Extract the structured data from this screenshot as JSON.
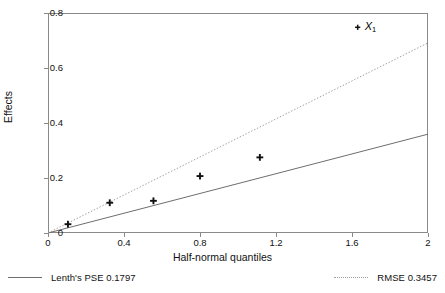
{
  "chart_data": {
    "type": "scatter",
    "title": "",
    "subtitle": "",
    "xlabel": "Half-normal quantiles",
    "ylabel": "Effects",
    "xlim": [
      0,
      2
    ],
    "ylim": [
      0,
      0.8
    ],
    "xticks": [
      "0",
      "0.4",
      "0.8",
      "1.2",
      "1.6",
      "2"
    ],
    "xtick_values": [
      0,
      0.4,
      0.8,
      1.2,
      1.6,
      2
    ],
    "yticks": [
      "0",
      "0.2",
      "0.4",
      "0.6",
      "0.8"
    ],
    "ytick_values": [
      0,
      0.2,
      0.4,
      0.6,
      0.8
    ],
    "grid": false,
    "frame": true,
    "legend_position": "below-axes",
    "points": [
      {
        "x": 0.105,
        "y": 0.032,
        "label": ""
      },
      {
        "x": 0.325,
        "y": 0.11,
        "label": ""
      },
      {
        "x": 0.555,
        "y": 0.117,
        "label": ""
      },
      {
        "x": 0.8,
        "y": 0.207,
        "label": ""
      },
      {
        "x": 1.115,
        "y": 0.275,
        "label": ""
      },
      {
        "x": 1.63,
        "y": 0.748,
        "label": "X",
        "label_sub": "1"
      }
    ],
    "series": [
      {
        "name": "Lenth's PSE 0.1797",
        "type": "line",
        "style": "solid",
        "slope": 0.1797,
        "intercept": 0,
        "color": "#6e6e6e",
        "x": [
          0,
          2
        ],
        "values": [
          0,
          0.3594
        ]
      },
      {
        "name": "RMSE 0.3457",
        "type": "line",
        "style": "dotted",
        "slope": 0.3457,
        "intercept": 0,
        "color": "#9e9e9e",
        "x": [
          0,
          2
        ],
        "values": [
          0,
          0.6914
        ]
      }
    ],
    "annotations": [
      {
        "text": "X1",
        "x": 1.63,
        "y": 0.748,
        "note": "labels the largest effect point"
      }
    ]
  },
  "axes": {
    "x_title": "Half-normal quantiles",
    "y_title": "Effects"
  },
  "legend": {
    "entries": [
      {
        "swatch": "solid-line",
        "label": "Lenth's PSE 0.1797"
      },
      {
        "swatch": "dotted-line",
        "label": "RMSE 0.3457"
      }
    ]
  },
  "colors": {
    "frame": "#8a8a8a",
    "point": "#111111",
    "lenth_line": "#6e6e6e",
    "rmse_line": "#9e9e9e",
    "text": "#111111",
    "background": "#ffffff"
  }
}
